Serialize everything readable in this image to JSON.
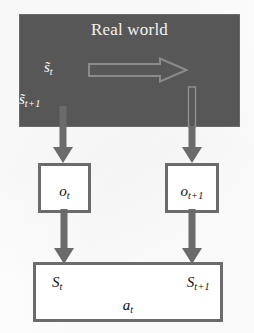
{
  "diagram": {
    "colors": {
      "panel_dark": "#575757",
      "panel_border": "#6a6a6a",
      "box_border": "#6b6b6b",
      "box_fill": "#ffffff",
      "arrow_solid": "#6b6b6b",
      "arrow_outline": "#8a8a8a",
      "panel_text": "#f2f2f2",
      "box_text": "#111111",
      "background": "#ffffff"
    },
    "real_world_panel": {
      "title": "Real world",
      "hidden_states": [
        {
          "name": "hidden-state-t",
          "base": "s̃",
          "subscript": "t"
        },
        {
          "name": "hidden-state-t1",
          "base": "s̃",
          "subscript": "t+1"
        }
      ],
      "transition_arrow": {
        "name": "world-transition-arrow",
        "direction": "right",
        "style": "outlined"
      }
    },
    "observation_boxes": [
      {
        "name": "observation-box-t",
        "base": "o",
        "subscript": "t"
      },
      {
        "name": "observation-box-t1",
        "base": "o",
        "subscript": "t+1"
      }
    ],
    "emission_arrows": [
      {
        "name": "emission-arrow-t",
        "direction": "down",
        "style": "solid"
      },
      {
        "name": "emission-arrow-t1",
        "direction": "down",
        "style": "solid-with-outlined-stem"
      }
    ],
    "belief_arrows": [
      {
        "name": "belief-arrow-t",
        "direction": "down",
        "style": "solid"
      },
      {
        "name": "belief-arrow-t1",
        "direction": "down",
        "style": "solid"
      }
    ],
    "state_box": {
      "name": "agent-state-box",
      "state_left": {
        "base": "S",
        "subscript": "t"
      },
      "state_right": {
        "base": "S",
        "subscript": "t+1"
      },
      "action": {
        "base": "a",
        "subscript": "t"
      }
    }
  }
}
